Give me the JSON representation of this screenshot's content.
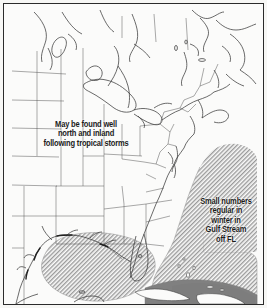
{
  "figure": {
    "kind": "species-range-map",
    "region": "Eastern North America, Gulf of Mexico and western Atlantic",
    "background_color": "#fbfbfa",
    "frame_color": "#2b2b2b",
    "outline_color": "#3a3a3a",
    "border_color": "#555555",
    "hatch_color": "#9a9a9a",
    "dark_range_color": "#808080"
  },
  "annotations": [
    {
      "id": "inland",
      "name": "annotation-inland",
      "lines": [
        "May be found well",
        "north and inland",
        "following tropical storms"
      ]
    },
    {
      "id": "gulfstream",
      "name": "annotation-gulf-stream",
      "lines": [
        "Small numbers",
        "regular in",
        "winter in",
        "Gulf Stream",
        "off FL"
      ]
    }
  ],
  "legend_regions": [
    {
      "id": "hatched",
      "label": "Hatched range",
      "color": "#9a9a9a"
    },
    {
      "id": "dark",
      "label": "Dark range",
      "color": "#808080"
    }
  ]
}
